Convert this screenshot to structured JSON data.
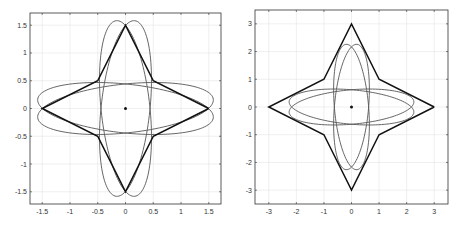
{
  "chart_data": [
    {
      "type": "line",
      "title": "",
      "xlabel": "",
      "ylabel": "",
      "xlim": [
        -1.72,
        1.72
      ],
      "ylim": [
        -1.72,
        1.72
      ],
      "grid": true,
      "xticks": [
        -1.5,
        -1,
        -0.5,
        0,
        0.5,
        1,
        1.5
      ],
      "xtick_labels": [
        "-1.5",
        "-1",
        "-0.5",
        "0",
        "0.5",
        "1",
        "1.5"
      ],
      "yticks": [
        -1.5,
        -1,
        -0.5,
        0,
        0.5,
        1,
        1.5
      ],
      "ytick_labels": [
        "-1.5",
        "-1",
        "-0.5",
        "0",
        "0.5",
        "1",
        "1.5"
      ],
      "center_point": [
        0,
        0
      ],
      "star": {
        "name": "star polygon",
        "points": [
          [
            1.5,
            0
          ],
          [
            0.5,
            0.5
          ],
          [
            0,
            1.5
          ],
          [
            -0.5,
            0.5
          ],
          [
            -1.5,
            0
          ],
          [
            -0.5,
            -0.5
          ],
          [
            0,
            -1.5
          ],
          [
            0.5,
            -0.5
          ],
          [
            1.5,
            0
          ]
        ]
      },
      "ellipses": [
        {
          "name": "horizontal ellipse A",
          "center": [
            0,
            0
          ],
          "a": 1.59,
          "b": 0.44,
          "angle_deg": 6
        },
        {
          "name": "horizontal ellipse B",
          "center": [
            0,
            0
          ],
          "a": 1.59,
          "b": 0.44,
          "angle_deg": -6
        },
        {
          "name": "vertical ellipse A",
          "center": [
            0,
            0
          ],
          "a": 1.59,
          "b": 0.44,
          "angle_deg": 84
        },
        {
          "name": "vertical ellipse B",
          "center": [
            0,
            0
          ],
          "a": 1.59,
          "b": 0.44,
          "angle_deg": 96
        }
      ]
    },
    {
      "type": "line",
      "title": "",
      "xlabel": "",
      "ylabel": "",
      "xlim": [
        -3.5,
        3.5
      ],
      "ylim": [
        -3.5,
        3.5
      ],
      "grid": true,
      "xticks": [
        -3,
        -2,
        -1,
        0,
        1,
        2,
        3
      ],
      "xtick_labels": [
        "-3",
        "-2",
        "-1",
        "0",
        "1",
        "2",
        "3"
      ],
      "yticks": [
        -3,
        -2,
        -1,
        0,
        1,
        2,
        3
      ],
      "ytick_labels": [
        "-3",
        "-2",
        "-1",
        "0",
        "1",
        "2",
        "3"
      ],
      "center_point": [
        0,
        0
      ],
      "star": {
        "name": "star polygon",
        "points": [
          [
            3,
            0
          ],
          [
            1,
            1
          ],
          [
            0,
            3
          ],
          [
            -1,
            1
          ],
          [
            -3,
            0
          ],
          [
            -1,
            -1
          ],
          [
            0,
            -3
          ],
          [
            1,
            -1
          ],
          [
            3,
            0
          ]
        ]
      },
      "ellipses": [
        {
          "name": "horizontal ellipse A",
          "center": [
            0,
            0
          ],
          "a": 2.27,
          "b": 0.62,
          "angle_deg": 5
        },
        {
          "name": "horizontal ellipse B",
          "center": [
            0,
            0
          ],
          "a": 2.27,
          "b": 0.62,
          "angle_deg": -5
        },
        {
          "name": "vertical ellipse A",
          "center": [
            0,
            0
          ],
          "a": 2.27,
          "b": 0.62,
          "angle_deg": 85
        },
        {
          "name": "vertical ellipse B",
          "center": [
            0,
            0
          ],
          "a": 2.27,
          "b": 0.62,
          "angle_deg": 95
        }
      ]
    }
  ]
}
